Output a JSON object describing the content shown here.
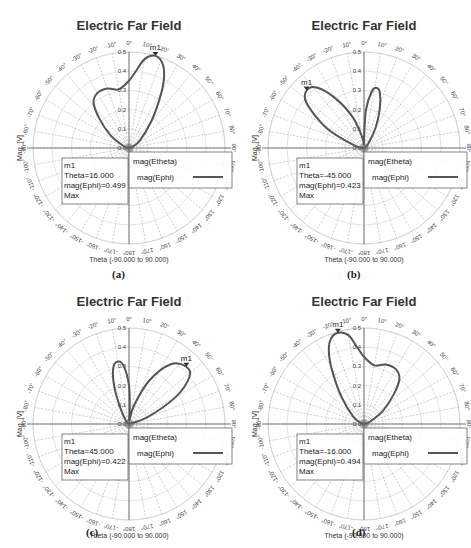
{
  "figure": {
    "panels": [
      {
        "id": "a",
        "caption": "(a)"
      },
      {
        "id": "b",
        "caption": "(b)"
      },
      {
        "id": "c",
        "caption": "(c)"
      },
      {
        "id": "d",
        "caption": "(d)"
      }
    ]
  },
  "chart_data": [
    {
      "type": "polar",
      "panel": "a",
      "title": "Electric Far Field",
      "xlabel": "Theta (-90.000 to 90.000)",
      "ylabel": "Mag. [V]",
      "radial_ticks": [
        "0.0",
        "0.1",
        "0.2",
        "0.3",
        "0.4",
        "0.5"
      ],
      "rlim": [
        0,
        0.5
      ],
      "angle_ticks_deg": [
        0,
        10,
        20,
        30,
        40,
        50,
        60,
        70,
        80,
        90,
        100,
        110,
        120,
        130,
        140,
        150,
        160,
        170,
        180,
        -170,
        -160,
        -150,
        -140,
        -130,
        -120,
        -110,
        -100,
        -90,
        -80,
        -70,
        -60,
        -50,
        -40,
        -30,
        -20,
        -10
      ],
      "legend": [
        "mag(Etheta)",
        "mag(Ephi)"
      ],
      "series": [
        {
          "name": "mag(Ephi)",
          "theta": [
            -90,
            -70,
            -55,
            -45,
            -38,
            -30,
            -20,
            -10,
            0,
            5,
            10,
            16,
            22,
            27,
            32,
            40,
            55,
            70,
            90
          ],
          "r": [
            0,
            0.03,
            0.12,
            0.22,
            0.3,
            0.33,
            0.33,
            0.31,
            0.35,
            0.4,
            0.47,
            0.499,
            0.47,
            0.4,
            0.3,
            0.18,
            0.07,
            0.02,
            0
          ]
        }
      ],
      "marker": {
        "name": "m1",
        "theta": 16.0,
        "value": 0.499,
        "lines": [
          "m1",
          "Theta=16.000",
          "mag(Ephi)=0.499",
          "Max"
        ]
      }
    },
    {
      "type": "polar",
      "panel": "b",
      "title": "Electric Far Field",
      "xlabel": "Theta (-90.000 to 90.000)",
      "ylabel": "Mag. [V]",
      "radial_ticks": [
        "0.0",
        "0.1",
        "0.2",
        "0.3",
        "0.4",
        "0.5"
      ],
      "rlim": [
        0,
        0.5
      ],
      "angle_ticks_deg": [
        0,
        10,
        20,
        30,
        40,
        50,
        60,
        70,
        80,
        90,
        100,
        110,
        120,
        130,
        140,
        150,
        160,
        170,
        180,
        -170,
        -160,
        -150,
        -140,
        -130,
        -120,
        -110,
        -100,
        -90,
        -80,
        -70,
        -60,
        -50,
        -40,
        -30,
        -20,
        -10
      ],
      "legend": [
        "mag(Etheta)",
        "mag(Ephi)"
      ],
      "series": [
        {
          "name": "mag(Ephi)",
          "theta": [
            -90,
            -75,
            -62,
            -52,
            -45,
            -38,
            -30,
            -20,
            -10,
            -3,
            0,
            3,
            8,
            12,
            16,
            22,
            30,
            45,
            90
          ],
          "r": [
            0,
            0.05,
            0.22,
            0.38,
            0.423,
            0.4,
            0.3,
            0.17,
            0.06,
            0.02,
            0.05,
            0.2,
            0.3,
            0.32,
            0.3,
            0.22,
            0.12,
            0.03,
            0
          ]
        }
      ],
      "marker": {
        "name": "m1",
        "theta": -45.0,
        "value": 0.423,
        "lines": [
          "m1",
          "Theta=-45.000",
          "mag(Ephi)=0.423",
          "Max"
        ]
      }
    },
    {
      "type": "polar",
      "panel": "c",
      "title": "Electric Far Field",
      "xlabel": "Theta (-90.000 to 90.000)",
      "ylabel": "Mag. [V]",
      "radial_ticks": [
        "0.0",
        "0.1",
        "0.2",
        "0.3",
        "0.4",
        "0.5"
      ],
      "rlim": [
        0,
        0.5
      ],
      "angle_ticks_deg": [
        0,
        10,
        20,
        30,
        40,
        50,
        60,
        70,
        80,
        90,
        100,
        110,
        120,
        130,
        140,
        150,
        160,
        170,
        180,
        -170,
        -160,
        -150,
        -140,
        -130,
        -120,
        -110,
        -100,
        -90,
        -80,
        -70,
        -60,
        -50,
        -40,
        -30,
        -20,
        -10
      ],
      "legend": [
        "mag(Etheta)",
        "mag(Ephi)"
      ],
      "series": [
        {
          "name": "mag(Ephi)",
          "theta": [
            -90,
            -45,
            -30,
            -22,
            -16,
            -10,
            -5,
            0,
            3,
            5,
            15,
            25,
            35,
            45,
            52,
            60,
            70,
            90
          ],
          "r": [
            0,
            0.02,
            0.08,
            0.2,
            0.3,
            0.33,
            0.3,
            0.2,
            0.07,
            0.02,
            0.1,
            0.25,
            0.38,
            0.422,
            0.4,
            0.28,
            0.1,
            0
          ]
        }
      ],
      "marker": {
        "name": "m1",
        "theta": 45.0,
        "value": 0.422,
        "lines": [
          "m1",
          "Theta=45.000",
          "mag(Ephi)=0.422",
          "Max"
        ]
      }
    },
    {
      "type": "polar",
      "panel": "d",
      "title": "Electric Far Field",
      "xlabel": "Theta (-90.000 to 90.000)",
      "ylabel": "Mag. [V]",
      "radial_ticks": [
        "0.0",
        "0.1",
        "0.2",
        "0.3",
        "0.4",
        "0.5"
      ],
      "rlim": [
        0,
        0.5
      ],
      "angle_ticks_deg": [
        0,
        10,
        20,
        30,
        40,
        50,
        60,
        70,
        80,
        90,
        100,
        110,
        120,
        130,
        140,
        150,
        160,
        170,
        180,
        -170,
        -160,
        -150,
        -140,
        -130,
        -120,
        -110,
        -100,
        -90,
        -80,
        -70,
        -60,
        -50,
        -40,
        -30,
        -20,
        -10
      ],
      "legend": [
        "mag(Etheta)",
        "mag(Ephi)"
      ],
      "series": [
        {
          "name": "mag(Ephi)",
          "theta": [
            -90,
            -70,
            -55,
            -40,
            -32,
            -27,
            -22,
            -16,
            -10,
            -5,
            0,
            10,
            20,
            30,
            38,
            45,
            55,
            70,
            90
          ],
          "r": [
            0,
            0.02,
            0.07,
            0.18,
            0.3,
            0.4,
            0.47,
            0.494,
            0.47,
            0.4,
            0.35,
            0.31,
            0.33,
            0.33,
            0.3,
            0.22,
            0.12,
            0.03,
            0
          ]
        }
      ],
      "marker": {
        "name": "m1",
        "theta": -16.0,
        "value": 0.494,
        "lines": [
          "m1",
          "Theta=-16.000",
          "mag(Ephi)=0.494",
          "Max"
        ]
      }
    }
  ]
}
